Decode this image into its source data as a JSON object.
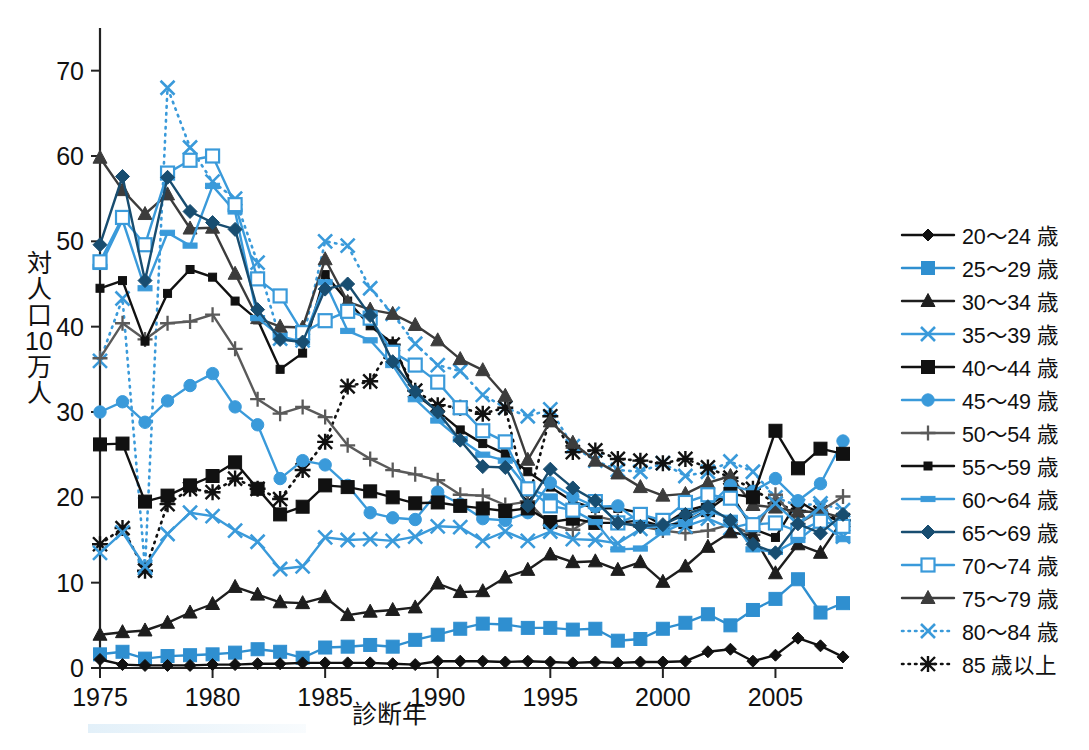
{
  "chart_data": {
    "type": "line",
    "title": "",
    "xlabel": "診断年",
    "ylabel": "対人口10万人",
    "ylabel_chars": [
      "対",
      "人",
      "口",
      "10",
      "万",
      "人"
    ],
    "xlim": [
      1975,
      2008
    ],
    "ylim": [
      0,
      75
    ],
    "ytick_values": [
      0,
      10,
      20,
      30,
      40,
      50,
      60,
      70
    ],
    "ytick_labels": [
      "0",
      "10",
      "20",
      "30",
      "40",
      "50",
      "60",
      "70"
    ],
    "xtick_values": [
      1975,
      1980,
      1985,
      1990,
      1995,
      2000,
      2005
    ],
    "xtick_labels": [
      "1975",
      "1980",
      "1985",
      "1990",
      "1995",
      "2000",
      "2005"
    ],
    "grid": false,
    "legend_position": "right",
    "x": [
      1975,
      1976,
      1977,
      1978,
      1979,
      1980,
      1981,
      1982,
      1983,
      1984,
      1985,
      1986,
      1987,
      1988,
      1989,
      1990,
      1991,
      1992,
      1993,
      1994,
      1995,
      1996,
      1997,
      1998,
      1999,
      2000,
      2001,
      2002,
      2003,
      2004,
      2005,
      2006,
      2007,
      2008
    ],
    "series": [
      {
        "name": "20～24 歳",
        "color": "#111111",
        "marker": "diamond",
        "dash": "solid",
        "values": [
          1.0,
          0.4,
          0.3,
          0.3,
          0.3,
          0.4,
          0.4,
          0.5,
          0.5,
          0.6,
          0.6,
          0.6,
          0.6,
          0.5,
          0.4,
          0.8,
          0.8,
          0.8,
          0.7,
          0.8,
          0.7,
          0.6,
          0.7,
          0.6,
          0.7,
          0.7,
          0.8,
          1.9,
          2.2,
          0.8,
          1.5,
          3.5,
          2.6,
          1.3
        ]
      },
      {
        "name": "25～29 歳",
        "color": "#2f8fd0",
        "marker": "square",
        "dash": "solid",
        "values": [
          1.6,
          1.9,
          1.1,
          1.4,
          1.5,
          1.6,
          1.8,
          2.2,
          1.9,
          1.2,
          2.4,
          2.5,
          2.7,
          2.5,
          3.3,
          3.9,
          4.6,
          5.2,
          5.1,
          4.7,
          4.7,
          4.5,
          4.6,
          3.2,
          3.4,
          4.6,
          5.3,
          6.3,
          5.0,
          6.8,
          8.1,
          10.4,
          6.5,
          7.6
        ]
      },
      {
        "name": "30～34 歳",
        "color": "#1e1e1e",
        "marker": "triangle",
        "dash": "solid",
        "values": [
          3.9,
          4.2,
          4.4,
          5.3,
          6.5,
          7.5,
          9.5,
          8.6,
          7.7,
          7.6,
          8.3,
          6.2,
          6.6,
          6.8,
          7.1,
          9.9,
          8.9,
          9.0,
          10.6,
          11.5,
          13.3,
          12.4,
          12.5,
          11.5,
          12.4,
          10.1,
          11.9,
          14.2,
          15.9,
          15.5,
          11.1,
          14.5,
          13.5,
          17.4
        ]
      },
      {
        "name": "35～39 歳",
        "color": "#3a9ada",
        "marker": "cross",
        "dash": "solid",
        "values": [
          13.5,
          15.9,
          11.9,
          15.7,
          18.2,
          17.8,
          16.1,
          14.8,
          11.6,
          11.9,
          15.3,
          15.0,
          15.1,
          14.9,
          15.4,
          16.6,
          16.5,
          14.9,
          16.0,
          14.9,
          16.0,
          15.1,
          15.0,
          14.6,
          16.3,
          16.8,
          16.6,
          17.5,
          16.4,
          17.0,
          19.3,
          16.8,
          18.9,
          15.4
        ]
      },
      {
        "name": "40～44 歳",
        "color": "#111111",
        "marker": "filled-square",
        "dash": "solid",
        "values": [
          26.2,
          26.3,
          19.5,
          20.2,
          21.4,
          22.5,
          24.1,
          21.0,
          18.0,
          18.9,
          21.4,
          21.2,
          20.7,
          20.0,
          19.3,
          19.4,
          19.0,
          18.7,
          18.4,
          18.7,
          17.1,
          17.5,
          17.0,
          17.0,
          17.3,
          16.6,
          17.1,
          18.5,
          20.4,
          20.0,
          27.8,
          23.4,
          25.7,
          25.1
        ]
      },
      {
        "name": "45～49 歳",
        "color": "#3a9ada",
        "marker": "circle",
        "dash": "solid",
        "values": [
          30.0,
          31.2,
          28.8,
          31.3,
          33.1,
          34.5,
          30.6,
          28.5,
          22.2,
          24.3,
          23.8,
          21.4,
          18.2,
          17.6,
          17.4,
          20.6,
          19.2,
          17.5,
          17.3,
          18.2,
          21.7,
          20.1,
          18.9,
          19.0,
          17.0,
          16.3,
          17.5,
          18.9,
          21.4,
          20.7,
          22.2,
          19.6,
          21.6,
          26.6
        ]
      },
      {
        "name": "50～54 歳",
        "color": "#5a5a5a",
        "marker": "plus",
        "dash": "solid",
        "values": [
          36.3,
          40.4,
          38.5,
          40.4,
          40.6,
          41.4,
          37.4,
          31.5,
          29.8,
          30.6,
          29.4,
          26.1,
          24.5,
          23.2,
          22.7,
          22.0,
          20.3,
          20.2,
          19.1,
          19.5,
          16.8,
          16.2,
          17.8,
          17.2,
          16.6,
          16.1,
          15.8,
          16.1,
          16.8,
          15.6,
          20.3,
          16.9,
          18.4,
          20.1
        ]
      },
      {
        "name": "55～59 歳",
        "color": "#111111",
        "marker": "small-square",
        "dash": "solid",
        "values": [
          44.5,
          45.4,
          38.3,
          43.9,
          46.7,
          45.8,
          43.0,
          40.8,
          35.0,
          36.9,
          46.1,
          43.0,
          40.1,
          38.0,
          32.1,
          30.1,
          27.9,
          26.3,
          25.1,
          23.0,
          21.2,
          19.5,
          18.7,
          18.7,
          18.2,
          16.7,
          18.4,
          19.1,
          20.5,
          16.3,
          15.3,
          19.6,
          18.0,
          17.1
        ]
      },
      {
        "name": "60～64 歳",
        "color": "#3a9ada",
        "marker": "line-square",
        "dash": "solid",
        "values": [
          47.0,
          52.5,
          44.5,
          51.0,
          49.5,
          56.5,
          53.5,
          41.0,
          38.9,
          38.2,
          45.2,
          39.5,
          38.4,
          35.5,
          31.5,
          29.0,
          26.8,
          25.0,
          24.3,
          21.0,
          20.1,
          18.5,
          17.1,
          13.9,
          14.0,
          15.9,
          17.1,
          18.4,
          17.6,
          13.9,
          13.6,
          15.0,
          17.0,
          15.1
        ]
      },
      {
        "name": "65～69 歳",
        "color": "#184d70",
        "marker": "filled-diamond",
        "dash": "solid",
        "values": [
          49.6,
          57.6,
          45.4,
          57.5,
          53.5,
          52.2,
          51.4,
          42.0,
          38.5,
          38.2,
          44.4,
          45.0,
          41.3,
          35.9,
          32.4,
          30.0,
          26.7,
          23.6,
          23.5,
          19.0,
          23.3,
          21.1,
          19.6,
          17.0,
          16.6,
          16.8,
          18.0,
          18.9,
          17.3,
          14.5,
          13.5,
          16.9,
          15.8,
          18.0
        ]
      },
      {
        "name": "70～74 歳",
        "color": "#3a9ada",
        "marker": "open-square",
        "dash": "solid",
        "values": [
          47.6,
          52.8,
          49.6,
          58.0,
          59.5,
          60.0,
          54.3,
          45.6,
          43.6,
          39.3,
          40.7,
          41.8,
          41.0,
          37.0,
          35.5,
          33.5,
          30.5,
          27.8,
          26.5,
          21.0,
          19.0,
          18.5,
          19.5,
          17.0,
          18.0,
          17.3,
          19.4,
          20.3,
          19.9,
          16.8,
          17.0,
          16.0,
          17.2,
          16.6
        ]
      },
      {
        "name": "75～79 歳",
        "color": "#3c3c3c",
        "marker": "triangle",
        "dash": "solid",
        "values": [
          59.8,
          56.0,
          53.2,
          55.5,
          51.5,
          51.6,
          46.2,
          41.0,
          40.0,
          39.9,
          47.9,
          42.9,
          42.0,
          41.5,
          40.2,
          38.4,
          36.2,
          34.9,
          31.9,
          24.4,
          28.9,
          26.4,
          24.3,
          22.8,
          21.2,
          20.2,
          20.4,
          21.7,
          22.5,
          19.1,
          18.8,
          18.3,
          18.3,
          17.6
        ]
      },
      {
        "name": "80～84 歳",
        "color": "#3a9ada",
        "marker": "cross",
        "dash": "dotted",
        "values": [
          36.0,
          43.3,
          11.7,
          68.0,
          61.0,
          57.0,
          55.0,
          47.5,
          38.6,
          38.4,
          50.0,
          49.5,
          44.5,
          41.5,
          38.0,
          35.5,
          34.8,
          32.0,
          30.5,
          29.5,
          30.3,
          26.0,
          24.3,
          23.2,
          23.0,
          24.0,
          22.5,
          23.0,
          24.2,
          23.0,
          20.0,
          19.0,
          19.3,
          18.5
        ]
      },
      {
        "name": "85 歳以上",
        "color": "#111111",
        "marker": "asterisk",
        "dash": "dotted",
        "values": [
          14.5,
          16.4,
          11.4,
          19.2,
          21.0,
          20.6,
          22.2,
          21.0,
          19.8,
          23.2,
          26.5,
          33.0,
          33.6,
          37.9,
          32.5,
          30.8,
          30.5,
          29.8,
          30.5,
          19.5,
          29.5,
          25.3,
          25.5,
          24.5,
          24.3,
          24.0,
          24.5,
          23.5,
          22.3,
          21.0,
          19.3,
          18.4,
          18.2,
          17.3
        ]
      }
    ]
  }
}
